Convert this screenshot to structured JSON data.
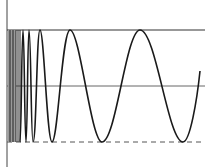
{
  "figure": {
    "colors": {
      "background": "#ffffff",
      "curve": "#1a1a1a",
      "axis": "#444444",
      "dense_region": "#9a9a9a"
    },
    "lines": {
      "upper_bound": {
        "y": 30,
        "style": "solid"
      },
      "center": {
        "y": 86,
        "style": "solid"
      },
      "lower_bound": {
        "y": 142,
        "style": "dashed"
      },
      "vertical_axis": {
        "x": 7,
        "style": "solid"
      }
    },
    "curve": {
      "peaks_x": [
        26,
        33,
        52,
        102,
        183
      ],
      "troughs_x": [
        23,
        29,
        40,
        70,
        140
      ],
      "end": {
        "x": 200,
        "y": 71
      }
    }
  }
}
